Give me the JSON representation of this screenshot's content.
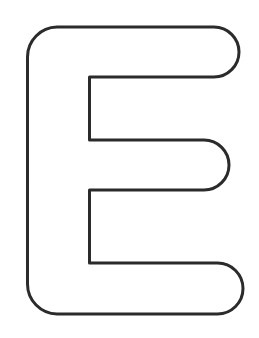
{
  "image": {
    "subject": "Outlined letter E",
    "letter": "E",
    "style": "bubble outline coloring page",
    "colors": {
      "background": "#ffffff",
      "stroke": "#2b2b2b",
      "fill": "#ffffff"
    },
    "stroke_width": 3
  }
}
